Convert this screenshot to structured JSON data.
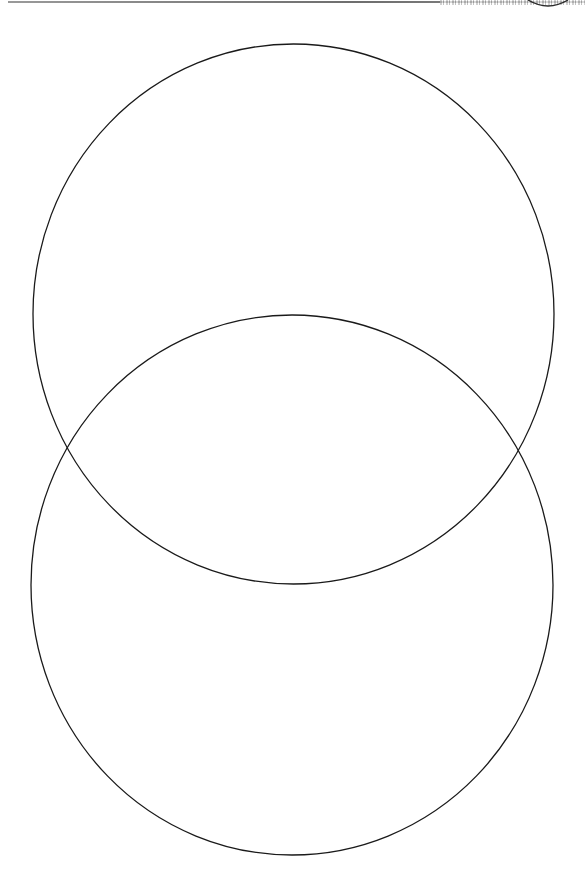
{
  "document": {
    "type": "scanned-worksheet",
    "top_edge": {
      "visible_text": ""
    }
  },
  "diagram": {
    "kind": "venn-two-set-vertical",
    "stroke_color": "#1a1a1a",
    "background_color": "#ffffff",
    "circles": [
      {
        "id": "top",
        "label": "",
        "cx": 293.5,
        "cy": 314,
        "rx": 260.5,
        "ry": 270
      },
      {
        "id": "bottom",
        "label": "",
        "cx": 292,
        "cy": 585,
        "rx": 261,
        "ry": 270
      }
    ],
    "intersection_points": [
      {
        "x": 67,
        "y": 448
      },
      {
        "x": 518,
        "y": 448
      }
    ]
  }
}
